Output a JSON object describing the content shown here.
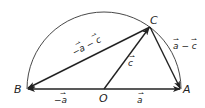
{
  "diagram": {
    "points": {
      "A": {
        "label": "A",
        "x": 181,
        "y": 89
      },
      "B": {
        "label": "B",
        "x": 27,
        "y": 89
      },
      "O": {
        "label": "O",
        "x": 104,
        "y": 89
      },
      "C": {
        "label": "C",
        "x": 150,
        "y": 27
      }
    },
    "semicircle": {
      "center": "O",
      "radius": 77
    },
    "vectors": [
      {
        "from": "O",
        "to": "A",
        "label": "a"
      },
      {
        "from": "O",
        "to": "B",
        "label": "−a"
      },
      {
        "from": "O",
        "to": "C",
        "label": "c"
      },
      {
        "from": "C",
        "to": "A",
        "label": "a − c"
      },
      {
        "from": "C",
        "to": "B",
        "label": "−a − c"
      }
    ],
    "colors": {
      "stroke": "#222222"
    }
  }
}
